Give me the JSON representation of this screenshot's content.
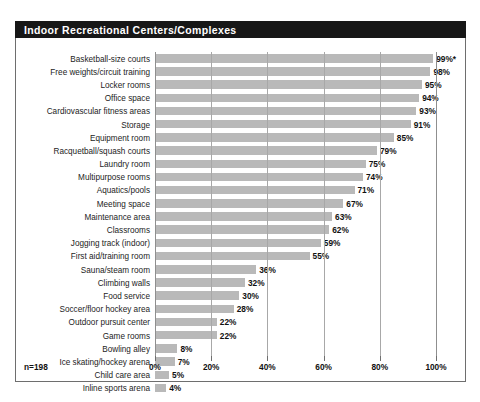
{
  "title": "Indoor Recreational Centers/Complexes",
  "footnote": "n=198",
  "chart_data": {
    "type": "bar",
    "orientation": "horizontal",
    "title": "Indoor Recreational Centers/Complexes",
    "xlabel": "",
    "ylabel": "",
    "xlim": [
      0,
      100
    ],
    "xticks": [
      0,
      20,
      40,
      60,
      80,
      100
    ],
    "xtick_labels": [
      "0%",
      "20%",
      "40%",
      "60%",
      "80%",
      "100%"
    ],
    "grid": true,
    "grid_axis": "x",
    "legend": false,
    "bar_color": "#b9b9b9",
    "sample_size_note": "n=198",
    "categories": [
      "Basketball-size courts",
      "Free weights/circuit training",
      "Locker rooms",
      "Office space",
      "Cardiovascular fitness areas",
      "Storage",
      "Equipment room",
      "Racquetball/squash courts",
      "Laundry room",
      "Multipurpose rooms",
      "Aquatics/pools",
      "Meeting space",
      "Maintenance area",
      "Classrooms",
      "Jogging track (indoor)",
      "First aid/training room",
      "Sauna/steam room",
      "Climbing walls",
      "Food service",
      "Soccer/floor hockey area",
      "Outdoor pursuit center",
      "Game rooms",
      "Bowling alley",
      "Ice skating/hockey arena",
      "Child care area",
      "Inline sports arena"
    ],
    "values": [
      99,
      98,
      95,
      94,
      93,
      91,
      85,
      79,
      75,
      74,
      71,
      67,
      63,
      62,
      59,
      55,
      36,
      32,
      30,
      28,
      22,
      22,
      8,
      7,
      5,
      4
    ],
    "value_labels": [
      "99%*",
      "98%",
      "95%",
      "94%",
      "93%",
      "91%",
      "85%",
      "79%",
      "75%",
      "74%",
      "71%",
      "67%",
      "63%",
      "62%",
      "59%",
      "55%",
      "36%",
      "32%",
      "30%",
      "28%",
      "22%",
      "22%",
      "8%",
      "7%",
      "5%",
      "4%"
    ]
  }
}
